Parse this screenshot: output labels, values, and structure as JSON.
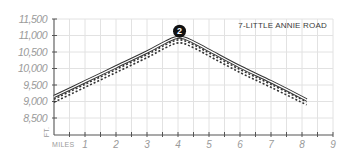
{
  "chart_data": {
    "type": "line",
    "title": "7-LITTLE ANNIE ROAD",
    "xlabel": "MILES",
    "ylabel": "FT.",
    "xlim": [
      0,
      9
    ],
    "ylim": [
      8000,
      11500
    ],
    "x_ticks": [
      1,
      2,
      3,
      4,
      5,
      6,
      7,
      8,
      9
    ],
    "x_minor_ticks_every": 0.5,
    "y_ticks": [
      8500,
      9000,
      9500,
      10000,
      10500,
      11000,
      11500
    ],
    "y_tick_labels": [
      "8,500",
      "9,000",
      "9,500",
      "10,000",
      "10,500",
      "11,000",
      "11,500"
    ],
    "grid": true,
    "legend": null,
    "series": [
      {
        "name": "profile-solid",
        "style": "double-solid",
        "x": [
          0,
          1,
          2,
          3,
          3.6,
          4.05,
          4.5,
          5,
          6,
          7,
          8.15
        ],
        "values": [
          9150,
          9600,
          10050,
          10500,
          10800,
          10950,
          10800,
          10550,
          10050,
          9600,
          9050
        ]
      },
      {
        "name": "profile-dashed-upper",
        "style": "dashed",
        "x": [
          0,
          1,
          2,
          3,
          3.6,
          4.05,
          4.5,
          5,
          6,
          7,
          8.15
        ],
        "values": [
          9070,
          9520,
          9970,
          10420,
          10720,
          10870,
          10720,
          10470,
          9970,
          9520,
          8990
        ]
      },
      {
        "name": "profile-dashed-lower",
        "style": "dashed",
        "x": [
          0,
          1,
          2,
          3,
          3.6,
          4.05,
          4.5,
          5,
          6,
          7,
          8.15
        ],
        "values": [
          8980,
          9430,
          9880,
          10330,
          10630,
          10780,
          10630,
          10380,
          9880,
          9430,
          8900
        ]
      }
    ],
    "annotations": [
      {
        "type": "marker",
        "label": "2",
        "x": 4.05,
        "y": 11130
      }
    ],
    "colors": {
      "line": "#333333",
      "grid": "#e2e2e2",
      "axis": "#555555",
      "tick_label": "#9a9a9a",
      "marker_fill": "#111111"
    }
  }
}
